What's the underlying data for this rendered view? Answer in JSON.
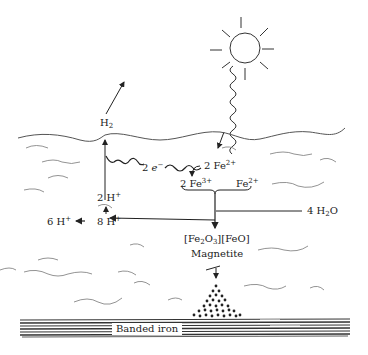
{
  "diagram": {
    "title": "",
    "labels": {
      "h2": {
        "base": "H",
        "sub": "2"
      },
      "electrons": {
        "coef": "2 ",
        "base": "e",
        "sup": "−"
      },
      "fe2_top": {
        "coef": "2 Fe",
        "sup": "2+"
      },
      "fe3": {
        "coef": "2 Fe",
        "sup": "3+"
      },
      "fe2_right": {
        "base": "Fe",
        "sup": "2+"
      },
      "h_2": {
        "coef": "2 H",
        "sup": "+"
      },
      "h_8": {
        "coef": "8 H",
        "sup": "+"
      },
      "h_6": {
        "coef": "6 H",
        "sup": "+"
      },
      "water": {
        "coef": "4 H",
        "sub": "2",
        "tail": "O"
      },
      "magnetite_formula": {
        "p1": "[Fe",
        "s1": "2",
        "p2": "O",
        "s2": "3",
        "p3": "][FeO]"
      },
      "magnetite_name": "Magnetite",
      "banded_iron": "Banded iron"
    },
    "icons": [
      "sun-icon",
      "photon-wave-icon",
      "arrow-icon",
      "water-wave-icon",
      "sediment-particles-icon",
      "banded-iron-layers-icon"
    ],
    "colors": {
      "ink": "#222222",
      "water_line": "#555555",
      "background": "#ffffff"
    }
  }
}
